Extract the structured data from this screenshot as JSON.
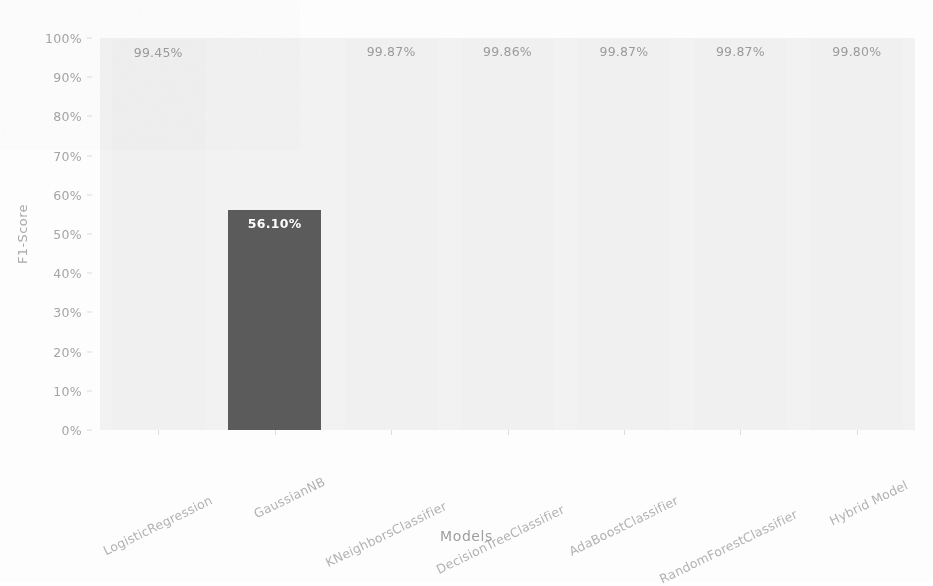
{
  "chart_data": {
    "type": "bar",
    "title": "",
    "xlabel": "Models",
    "ylabel": "F1-Score",
    "categories": [
      "LogisticRegression",
      "GaussianNB",
      "KNeighborsClassifier",
      "DecisionTreeClassifier",
      "AdaBoostClassifier",
      "RandomForestClassifier",
      "Hybrid Model"
    ],
    "values": [
      99.45,
      56.1,
      99.87,
      99.86,
      99.87,
      99.87,
      99.8
    ],
    "value_labels": [
      "99.45%",
      "56.10%",
      "99.87%",
      "99.86%",
      "99.87%",
      "99.87%",
      "99.80%"
    ],
    "ylim": [
      0,
      100
    ],
    "ytick_labels": [
      "0%",
      "10%",
      "20%",
      "30%",
      "40%",
      "50%",
      "60%",
      "70%",
      "80%",
      "90%",
      "100%"
    ],
    "ytick_values": [
      0,
      10,
      20,
      30,
      40,
      50,
      60,
      70,
      80,
      90,
      100
    ],
    "grid": false,
    "legend": "none",
    "bar_color": "#f0f0f0",
    "highlight_color": "#5b5b5b",
    "highlight_index": 1,
    "plot_background": "#f2f2f2",
    "figure_background": "#fdfdfd",
    "label_color": "#9b9b9b",
    "inside_label_color": "#fdfdfd"
  }
}
